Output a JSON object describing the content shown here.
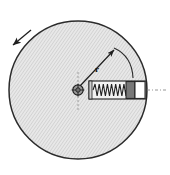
{
  "figure": {
    "background_color": "#ffffff",
    "width": 170,
    "height": 175
  },
  "disc": {
    "name": "rotating-disc",
    "center_x": 78,
    "center_y": 90,
    "radius": 69,
    "fill_color": "#e8e8e8",
    "stroke_color": "#2b2b2b",
    "hatch_color": "#b9b9b9",
    "hatch_angle_deg": 35,
    "hatch_spacing": 2.6
  },
  "hub": {
    "name": "center-hub",
    "x": 78,
    "y": 90,
    "outer_radius": 5.2,
    "inner_radius": 2.2,
    "fill_color": "#9a9a9a",
    "stroke_color": "#1f1f1f"
  },
  "centerlines": {
    "vertical": {
      "x": 78,
      "y1": 72,
      "y2": 110,
      "dash": "2,2",
      "color": "#8a8a8a"
    },
    "horizontal_right": {
      "y": 90,
      "x1": 147,
      "x2": 168,
      "dash": "3,2,1,2",
      "color": "#8a8a8a"
    }
  },
  "radius_arrow": {
    "name": "radius-vector",
    "x1": 80,
    "y1": 86,
    "x2": 114,
    "y2": 50,
    "label": "r",
    "label_x": 95,
    "label_y": 72,
    "color": "#1f1f1f"
  },
  "sweep_arc": {
    "name": "angular-sweep-arc",
    "start_x": 114,
    "start_y": 48,
    "end_x": 133,
    "end_y": 78,
    "control_x": 132,
    "control_y": 56,
    "color": "#2b2b2b"
  },
  "rotation_arrow": {
    "name": "rotation-direction-arrow",
    "direction": "counterclockwise",
    "x1": 31,
    "y1": 30,
    "x2": 13,
    "y2": 45,
    "color": "#1f1f1f"
  },
  "spring_assembly": {
    "name": "spring-mass-assembly",
    "housing": {
      "x": 89,
      "y": 81,
      "width": 57,
      "height": 18,
      "fill_color": "#f2f2f2",
      "stroke_color": "#1f1f1f"
    },
    "left_cap": {
      "x": 89,
      "y": 81,
      "width": 3,
      "height": 18,
      "fill_color": "#d0d0d0"
    },
    "spring": {
      "name": "coil-spring",
      "x_start": 93,
      "x_end": 126,
      "y_center": 90,
      "amplitude": 6.0,
      "coils": 8,
      "color": "#1f1f1f"
    },
    "mass_block": {
      "name": "mass-block",
      "x": 126,
      "y": 81,
      "width": 9,
      "height": 18,
      "fill_color": "#787878",
      "stroke_color": "#1f1f1f"
    },
    "end_block": {
      "name": "end-block",
      "x": 135,
      "y": 81,
      "width": 10,
      "height": 18,
      "fill_color": "#ffffff",
      "stroke_color": "#1f1f1f"
    }
  },
  "labels": {
    "radius": "r"
  }
}
